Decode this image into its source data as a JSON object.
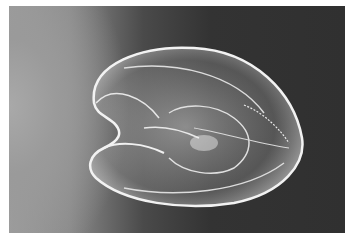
{
  "image": {
    "subject": "comb jelly (ctenophore) photograph",
    "style": "grayscale",
    "colors": {
      "border": "#ffffff",
      "background_left": "#9d9d9d",
      "background_right": "#303030",
      "body": "#e8e8e8"
    }
  }
}
